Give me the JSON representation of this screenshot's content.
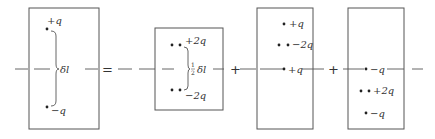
{
  "diagram": {
    "operators": {
      "equals": "=",
      "plus1": "+",
      "plus2": "+"
    },
    "panel1": {
      "charges": [
        {
          "label": "+q",
          "sign": "positive"
        },
        {
          "label": "−q",
          "sign": "negative"
        }
      ],
      "separation_label": "δl"
    },
    "panel2": {
      "charges": [
        {
          "label": "+2q",
          "sign": "positive"
        },
        {
          "label": "−2q",
          "sign": "negative"
        }
      ],
      "separation_fraction": "½",
      "separation_label": "δl"
    },
    "panel3": {
      "charges": [
        {
          "label": "+q"
        },
        {
          "label": "−2q"
        },
        {
          "label": "+q"
        }
      ]
    },
    "panel4": {
      "charges": [
        {
          "label": "−q"
        },
        {
          "label": "+2q"
        },
        {
          "label": "−q"
        }
      ]
    },
    "colors": {
      "ink": "#333333",
      "line": "#555555"
    }
  }
}
